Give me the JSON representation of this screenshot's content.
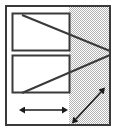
{
  "figure": {
    "type": "technical-diagram",
    "title": "",
    "canvas": {
      "width": 118,
      "height": 134
    },
    "colors": {
      "background": "#ffffff",
      "outline": "#3a3a3a",
      "hatch_fill": "#b3b3b3",
      "hatch_background": "#ffffff",
      "rectangle_fill": "#ffffff",
      "arrow": "#1a1a1a"
    },
    "outer_frame": {
      "name": "outer-frame",
      "label": "",
      "x": 5,
      "y": 5,
      "width": 106,
      "height": 121,
      "stroke_width": 2
    },
    "hatched_region": {
      "name": "hatched-region",
      "label": "",
      "x": 69,
      "y": 5,
      "width": 42,
      "height": 121,
      "pattern": "checker-dither"
    },
    "rectangles": [
      {
        "name": "upper-rectangle",
        "label": "",
        "x": 12,
        "y": 13,
        "width": 58,
        "height": 38
      },
      {
        "name": "lower-rectangle",
        "label": "",
        "x": 12,
        "y": 55,
        "width": 58,
        "height": 38
      }
    ],
    "chevrons": [
      {
        "name": "upper-chevron",
        "label": "",
        "points": "22,15 110,51"
      },
      {
        "name": "lower-chevron",
        "label": "",
        "points": "22,93 110,55"
      }
    ],
    "arrows": [
      {
        "name": "horizontal-dimension-arrow",
        "label": "",
        "orientation": "horizontal",
        "double_headed": true,
        "x1": 25,
        "y1": 110,
        "x2": 62,
        "y2": 110
      },
      {
        "name": "diagonal-dimension-arrow",
        "label": "",
        "orientation": "diagonal",
        "double_headed": true,
        "x1": 76,
        "y1": 119,
        "x2": 101,
        "y2": 92
      }
    ]
  }
}
